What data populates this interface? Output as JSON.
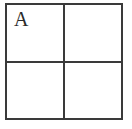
{
  "canvas": {
    "width": 132,
    "height": 129,
    "background": "#ffffff"
  },
  "grid": {
    "rows": 2,
    "cols": 2,
    "line_color": "#3a3a3a",
    "cell_background": "#ffffff",
    "label_color": "#2b2b2b",
    "cells": [
      {
        "row": 0,
        "col": 0,
        "label": "A"
      },
      {
        "row": 0,
        "col": 1,
        "label": ""
      },
      {
        "row": 1,
        "col": 0,
        "label": ""
      },
      {
        "row": 1,
        "col": 1,
        "label": ""
      }
    ]
  }
}
